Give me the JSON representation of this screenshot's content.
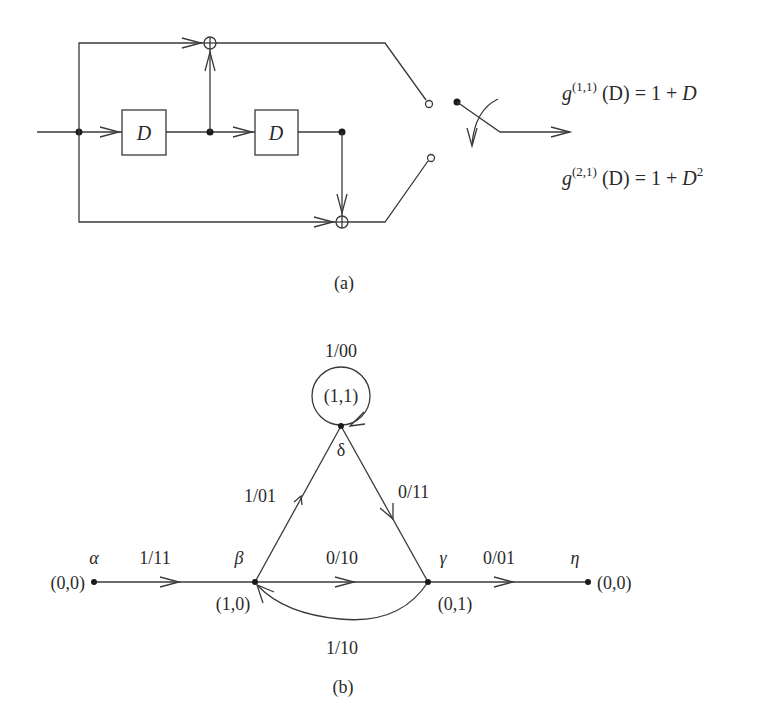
{
  "encoder": {
    "delay_label_1": "D",
    "delay_label_2": "D",
    "generators": [
      {
        "prefix": "g",
        "superscript": "(1,1)",
        "expr_lhs": " (D) = 1 + ",
        "expr_var": "D",
        "expr_exp": ""
      },
      {
        "prefix": "g",
        "superscript": "(2,1)",
        "expr_lhs": " (D) = 1 + ",
        "expr_var": "D",
        "expr_exp": "2"
      }
    ],
    "caption": "(a)"
  },
  "state_diagram": {
    "nodes": [
      {
        "id": "alpha",
        "greek": "α",
        "state": "(0,0)"
      },
      {
        "id": "beta",
        "greek": "β",
        "state": "(1,0)"
      },
      {
        "id": "delta",
        "greek": "δ",
        "state": "(1,1)"
      },
      {
        "id": "gamma",
        "greek": "γ",
        "state": "(0,1)"
      },
      {
        "id": "eta",
        "greek": "η",
        "state": "(0,0)"
      }
    ],
    "edges": [
      {
        "from": "alpha",
        "to": "beta",
        "label": "1/11"
      },
      {
        "from": "beta",
        "to": "delta",
        "label": "1/01"
      },
      {
        "from": "delta",
        "to": "delta",
        "label": "1/00"
      },
      {
        "from": "delta",
        "to": "gamma",
        "label": "0/11"
      },
      {
        "from": "beta",
        "to": "gamma",
        "label": "0/10"
      },
      {
        "from": "gamma",
        "to": "beta",
        "label": "1/10"
      },
      {
        "from": "gamma",
        "to": "eta",
        "label": "0/01"
      }
    ],
    "caption": "(b)"
  }
}
